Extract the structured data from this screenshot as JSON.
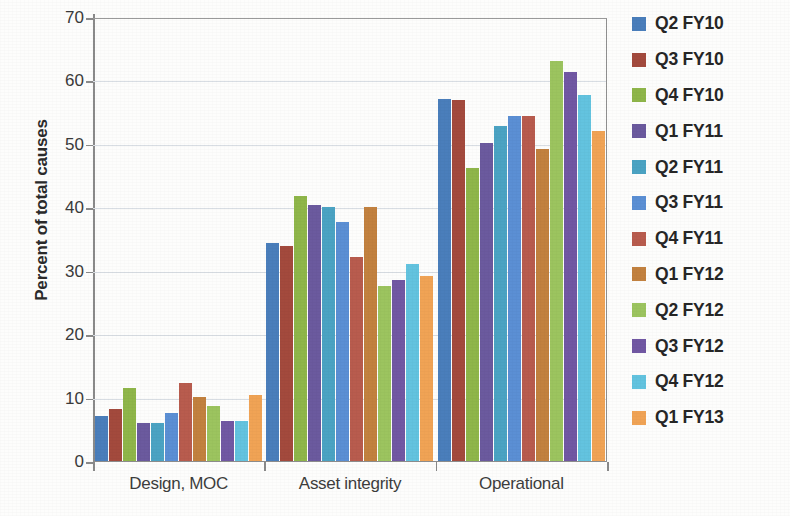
{
  "chart_data": {
    "type": "bar",
    "title": "",
    "xlabel": "",
    "ylabel": "Percent of total causes",
    "ylim": [
      0,
      70
    ],
    "yticks": [
      0,
      10,
      20,
      30,
      40,
      50,
      60,
      70
    ],
    "grid": true,
    "legend_position": "right",
    "categories": [
      "Design, MOC",
      "Asset integrity",
      "Operational"
    ],
    "series": [
      {
        "name": "Q2 FY10",
        "color": "#4a7ebb",
        "values": [
          7.3,
          34.6,
          57.3
        ]
      },
      {
        "name": "Q3 FY10",
        "color": "#a34a3d",
        "values": [
          8.3,
          34.0,
          57.0
        ]
      },
      {
        "name": "Q4 FY10",
        "color": "#8fb64a",
        "values": [
          11.6,
          42.0,
          46.3
        ]
      },
      {
        "name": "Q1 FY11",
        "color": "#6b5a9e",
        "values": [
          6.2,
          40.5,
          50.3
        ]
      },
      {
        "name": "Q2 FY11",
        "color": "#4ba3c3",
        "values": [
          6.2,
          40.2,
          53.0
        ]
      },
      {
        "name": "Q3 FY11",
        "color": "#5b8fd4",
        "values": [
          7.8,
          37.8,
          54.5
        ]
      },
      {
        "name": "Q4 FY11",
        "color": "#b85c4e",
        "values": [
          12.5,
          32.3,
          54.5
        ]
      },
      {
        "name": "Q1 FY12",
        "color": "#c2813f",
        "values": [
          10.2,
          40.2,
          49.3
        ]
      },
      {
        "name": "Q2 FY12",
        "color": "#9cc45f",
        "values": [
          8.8,
          27.8,
          63.2
        ]
      },
      {
        "name": "Q3 FY12",
        "color": "#7158a3",
        "values": [
          6.5,
          28.7,
          61.5
        ]
      },
      {
        "name": "Q4 FY12",
        "color": "#63c3df",
        "values": [
          6.5,
          31.2,
          57.8
        ]
      },
      {
        "name": "Q1 FY13",
        "color": "#f0a355",
        "values": [
          10.5,
          29.3,
          52.2
        ]
      }
    ]
  },
  "axis": {
    "y_title": "Percent of total causes",
    "y_tick_labels": [
      "0",
      "10",
      "20",
      "30",
      "40",
      "50",
      "60",
      "70"
    ],
    "x_tick_labels": [
      "Design, MOC",
      "Asset integrity",
      "Operational"
    ]
  },
  "legend": {
    "entries": [
      {
        "label": "Q2 FY10",
        "color": "#4a7ebb"
      },
      {
        "label": "Q3 FY10",
        "color": "#a34a3d"
      },
      {
        "label": "Q4 FY10",
        "color": "#8fb64a"
      },
      {
        "label": "Q1 FY11",
        "color": "#6b5a9e"
      },
      {
        "label": "Q2 FY11",
        "color": "#4ba3c3"
      },
      {
        "label": "Q3 FY11",
        "color": "#5b8fd4"
      },
      {
        "label": "Q4 FY11",
        "color": "#b85c4e"
      },
      {
        "label": "Q1 FY12",
        "color": "#c2813f"
      },
      {
        "label": "Q2 FY12",
        "color": "#9cc45f"
      },
      {
        "label": "Q3 FY12",
        "color": "#7158a3"
      },
      {
        "label": "Q4 FY12",
        "color": "#63c3df"
      },
      {
        "label": "Q1 FY13",
        "color": "#f0a355"
      }
    ]
  }
}
